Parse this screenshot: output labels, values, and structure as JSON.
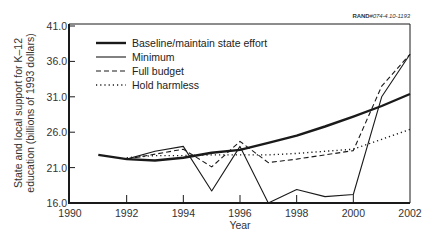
{
  "chart_data": {
    "type": "line",
    "title": "",
    "reference_code": {
      "prefix": "RAND",
      "code": "#074-4.10-1193"
    },
    "xlabel": "Year",
    "ylabel": "State and local support for K–12 education (billions of 1993 dollars)",
    "ylabel_lines": [
      "State and local support for K–12",
      "education (billions of 1993 dollars)"
    ],
    "xlim": [
      1990,
      2002
    ],
    "ylim": [
      16.0,
      41.0
    ],
    "x_ticks": [
      "1990",
      "1992",
      "1994",
      "1996",
      "1998",
      "2000",
      "2002"
    ],
    "y_ticks": [
      "16.0",
      "21.0",
      "26.0",
      "31.0",
      "36.0",
      "41.0"
    ],
    "grid": false,
    "legend_position": "upper-left",
    "series": [
      {
        "name": "Baseline/maintain state effort",
        "style": "thick-solid",
        "x": [
          1991,
          1992,
          1993,
          1994,
          1995,
          1996,
          1997,
          1998,
          1999,
          2000,
          2001,
          2002
        ],
        "values": [
          22.8,
          22.2,
          22.0,
          22.4,
          23.1,
          23.5,
          24.5,
          25.5,
          26.8,
          28.2,
          29.7,
          31.4
        ]
      },
      {
        "name": "Minimum",
        "style": "solid",
        "x": [
          1992,
          1993,
          1994,
          1995,
          1996,
          1997,
          1998,
          1999,
          2000,
          2001,
          2002
        ],
        "values": [
          22.2,
          23.3,
          24.0,
          17.7,
          24.0,
          16.0,
          17.9,
          16.9,
          17.2,
          31.0,
          37.0
        ]
      },
      {
        "name": "Full budget",
        "style": "dashed",
        "x": [
          1992,
          1994,
          1995,
          1996,
          1997,
          1998,
          1999,
          2000,
          2001,
          2002
        ],
        "values": [
          22.2,
          23.6,
          21.1,
          24.7,
          21.7,
          22.2,
          22.8,
          23.4,
          32.5,
          37.0
        ]
      },
      {
        "name": "Hold harmless",
        "style": "dotted",
        "x": [
          1992,
          1993,
          1994,
          1995,
          1996,
          1997,
          1998,
          1999,
          2000,
          2001,
          2002
        ],
        "values": [
          22.4,
          22.7,
          22.7,
          22.8,
          22.8,
          22.8,
          23.0,
          23.3,
          23.6,
          25.0,
          26.4
        ]
      }
    ],
    "colors": {
      "line": "#1a1a1a",
      "axis": "#1a1a1a",
      "text": "#333333",
      "background": "#ffffff"
    }
  }
}
